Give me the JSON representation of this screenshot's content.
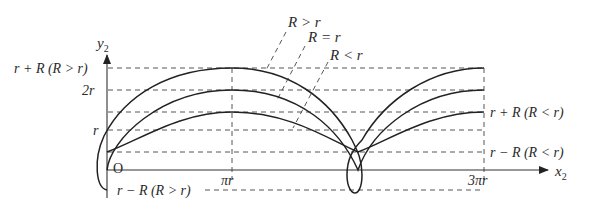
{
  "diagram": {
    "type": "trochoid curves",
    "axes": {
      "x_label": "x",
      "x_sub": "2",
      "y_label": "y",
      "y_sub": "2",
      "origin_label": "O"
    },
    "x_ticks": [
      {
        "label": "πr"
      },
      {
        "label": "3πr"
      }
    ],
    "y_levels": [
      {
        "label": "r + R (R > r)",
        "side": "left"
      },
      {
        "label": "2r",
        "side": "left"
      },
      {
        "label": "r",
        "side": "left"
      },
      {
        "label": "r + R (R < r)",
        "side": "right"
      },
      {
        "label": "r − R (R < r)",
        "side": "right"
      },
      {
        "label": "r − R (R > r)",
        "side": "left-bottom"
      }
    ],
    "curve_labels": [
      {
        "label": "R > r"
      },
      {
        "label": "R = r"
      },
      {
        "label": "R < r"
      }
    ]
  }
}
